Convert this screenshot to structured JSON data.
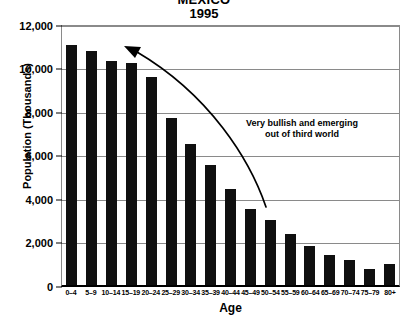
{
  "chart_data": {
    "type": "bar",
    "title": "MEXICO",
    "subtitle": "1995",
    "xlabel": "Age",
    "ylabel": "Population (Thousands)",
    "ylim": [
      0,
      12000
    ],
    "yticks": [
      "0",
      "2,000",
      "4,000",
      "6,000",
      "8,000",
      "10,000",
      "12,000"
    ],
    "ytick_values": [
      0,
      2000,
      4000,
      6000,
      8000,
      10000,
      12000
    ],
    "grid": true,
    "legend": "none",
    "bar_color": "#101010",
    "categories": [
      "0–4",
      "5–9",
      "10–14",
      "15–19",
      "20–24",
      "25–29",
      "30–34",
      "35–39",
      "40–44",
      "45–49",
      "50–54",
      "55–59",
      "60–64",
      "65–69",
      "70–74",
      "75–79",
      "80+"
    ],
    "values": [
      11050,
      10750,
      10300,
      10200,
      9550,
      7700,
      6500,
      5500,
      4400,
      3500,
      3000,
      2350,
      1800,
      1400,
      1150,
      750,
      950
    ],
    "annotations": [
      {
        "name": "bullish-note",
        "line1": "Very bullish and emerging",
        "line2": "out of third world",
        "arrow": "curved-arrow-pointing-up-left"
      }
    ]
  }
}
